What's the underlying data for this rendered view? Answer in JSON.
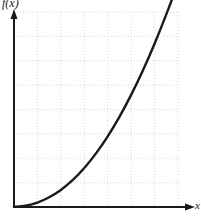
{
  "chart_data": {
    "type": "line",
    "title": "",
    "subtitle": "",
    "xlabel": "x",
    "ylabel": "f(x)",
    "legend": [],
    "legend_position": "none",
    "grid": true,
    "grid_style": "dotted",
    "grid_color": "#d8d8d8",
    "axis_color": "#1a1a1a",
    "curve_color": "#1a1a1a",
    "background_color": "#ffffff",
    "xlim": [
      0,
      7
    ],
    "ylim": [
      0,
      8
    ],
    "xticks": [
      0,
      1,
      2,
      3,
      4,
      5,
      6,
      7
    ],
    "yticks": [
      0,
      1,
      2,
      3,
      4,
      5,
      6,
      7,
      8
    ],
    "xtick_labels": [],
    "ytick_labels": [],
    "x_axis_arrow": true,
    "y_axis_arrow": true,
    "series": [
      {
        "name": "f(x)",
        "description": "monotonically increasing convex curve rising from the origin",
        "x": [
          0.0,
          0.5,
          1.0,
          1.5,
          2.0,
          2.5,
          3.0,
          3.5,
          4.0,
          4.5,
          5.0,
          5.5,
          6.0,
          6.5,
          7.0,
          7.3
        ],
        "values": [
          0.0,
          0.05,
          0.18,
          0.4,
          0.7,
          1.1,
          1.6,
          2.2,
          2.9,
          3.7,
          4.6,
          5.6,
          6.7,
          7.9,
          9.2,
          10.1
        ]
      }
    ],
    "annotations": []
  },
  "figure": {
    "ylabel_text": "f(x)",
    "xlabel_text": "x"
  }
}
